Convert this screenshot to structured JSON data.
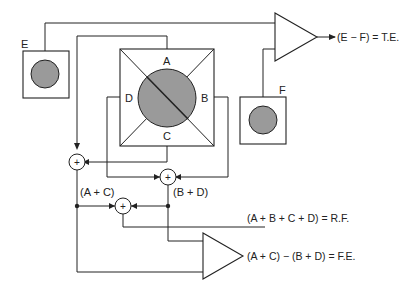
{
  "diagram": {
    "detectors": {
      "E": {
        "label": "E"
      },
      "F": {
        "label": "F"
      },
      "quad": {
        "label_a": "A",
        "label_b": "B",
        "label_c": "C",
        "label_d": "D"
      }
    },
    "summers": {
      "symbol": "+"
    },
    "node_labels": {
      "a_plus_c": "(A + C)",
      "b_plus_d": "(B + D)"
    },
    "outputs": {
      "tracking_error": "(E − F) = T.E.",
      "rf_signal": "(A + B + C + D) = R.F.",
      "focus_error": "(A + C) − (B + D) = F.E."
    },
    "colors": {
      "line": "#222222",
      "disc_fill": "#9a9a9a",
      "background": "#ffffff"
    }
  }
}
